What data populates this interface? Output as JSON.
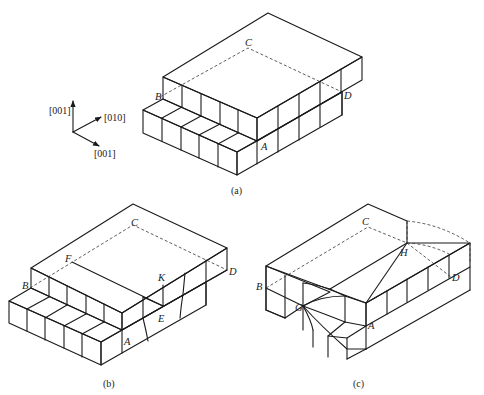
{
  "figure": {
    "axes": {
      "labels": [
        "[001]",
        "[010]",
        "[001]"
      ]
    },
    "panels": [
      {
        "caption": "(a)",
        "points": [
          "B",
          "C",
          "D",
          "A"
        ]
      },
      {
        "caption": "(b)",
        "points": [
          "B",
          "C",
          "D",
          "A",
          "F",
          "K",
          "E"
        ]
      },
      {
        "caption": "(c)",
        "points": [
          "B",
          "C",
          "D",
          "A",
          "G",
          "H"
        ]
      }
    ]
  }
}
